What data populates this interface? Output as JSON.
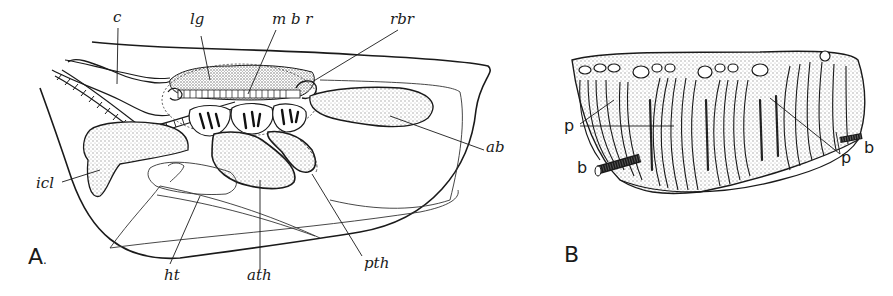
{
  "figure": {
    "panels": [
      {
        "id": "A",
        "letter": "A",
        "suffix": ".",
        "labels": {
          "c": "c",
          "lg": "lg",
          "mbr": "m b r",
          "rbr": "rbr",
          "ab": "ab",
          "icl": "icl",
          "ht": "ht",
          "ath": "ath",
          "pth": "pth"
        }
      },
      {
        "id": "B",
        "letter": "B",
        "labels": {
          "p_left": "p",
          "p_right": "p",
          "b_left": "b",
          "b_right": "b"
        }
      }
    ],
    "colors": {
      "ink": "#1a1a1a",
      "stipple": "#bdbdbd",
      "background": "#ffffff"
    }
  }
}
